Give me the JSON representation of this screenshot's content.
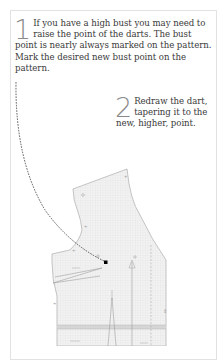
{
  "steps": [
    {
      "number": "1",
      "text": "If you have a high bust you may need to raise the point of the darts. The bust point is nearly always marked on the pattern. Mark the desired new bust point on the pattern."
    },
    {
      "number": "2",
      "text": "Redraw the dart, tapering it to the new, higher, point."
    }
  ],
  "illustration": {
    "subject": "bodice pattern piece with raised bust point",
    "colors": {
      "pattern_fill": "#f0f0f0",
      "pattern_outline": "#9a9a9a",
      "dashed_line": "#333333",
      "bust_point": "#000000",
      "frame_border": "#e2e2e2"
    }
  }
}
